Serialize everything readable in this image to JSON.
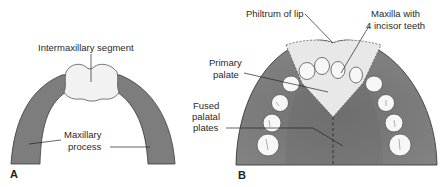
{
  "figure": {
    "panels": [
      {
        "id": "A",
        "letter": "A",
        "labels": {
          "intermaxillary": "Intermaxillary segment",
          "maxillary_line1": "Maxillary",
          "maxillary_line2": "process"
        }
      },
      {
        "id": "B",
        "letter": "B",
        "labels": {
          "philtrum": "Philtrum of lip",
          "maxilla_line1": "Maxilla with",
          "maxilla_line2": "4 incisor teeth",
          "primary_line1": "Primary",
          "primary_line2": "palate",
          "fused_line1": "Fused",
          "fused_line2": "palatal",
          "fused_line3": "plates"
        }
      }
    ],
    "colors": {
      "process_gray": "#7d7d7d",
      "outline": "#3a3a3a",
      "segment_light": "#f2f2f2",
      "tooth": "#f7f7f7",
      "palate_light": "#e6e6e6"
    }
  }
}
